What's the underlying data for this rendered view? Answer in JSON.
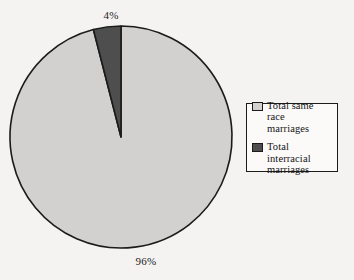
{
  "chart_data": {
    "type": "pie",
    "title": "",
    "subtitle": "",
    "xlabel": "",
    "ylabel": "",
    "categories": [
      "Total same race marriages",
      "Total interracial marriages"
    ],
    "values": [
      96,
      4
    ],
    "value_unit": "%",
    "data_labels": [
      "96%",
      "4%"
    ],
    "slice_colors": [
      "#d2d1cf",
      "#4e4e4e"
    ],
    "outline_color": "#1b1b1b",
    "start_angle_deg": 0,
    "direction": "counterclockwise",
    "legend": {
      "position": "right",
      "entries": [
        {
          "label": "Total same race marriages",
          "color": "#d2d1cf"
        },
        {
          "label": "Total interracial marriages",
          "color": "#4e4e4e"
        }
      ]
    },
    "grid": false,
    "background": "#f4f3f1"
  },
  "labels": {
    "small_slice": "4%",
    "large_slice": "96%"
  },
  "legend": {
    "entries": [
      {
        "line1": "Total same race",
        "line2": "marriages",
        "swatch_color": "#d2d1cf"
      },
      {
        "line1": "Total interracial",
        "line2": "marriages",
        "swatch_color": "#4e4e4e"
      }
    ]
  }
}
